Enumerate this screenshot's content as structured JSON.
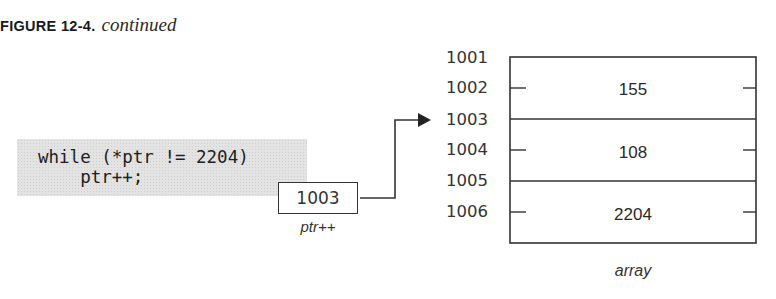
{
  "caption": {
    "label": "FIGURE 12-4.",
    "subtitle": "continued"
  },
  "code": {
    "lines": [
      "while (*ptr != 2204)",
      "    ptr++;"
    ]
  },
  "pointer": {
    "value": "1003",
    "label": "ptr++",
    "points_to_address": "1003"
  },
  "memory": {
    "addresses": [
      "1001",
      "1002",
      "1003",
      "1004",
      "1005",
      "1006"
    ],
    "cells": [
      {
        "start": "1001",
        "end": "1002",
        "value": "155"
      },
      {
        "start": "1003",
        "end": "1004",
        "value": "108"
      },
      {
        "start": "1005",
        "end": "1006",
        "value": "2204"
      }
    ],
    "label": "array"
  },
  "colors": {
    "code_background": "#e3e3e3",
    "line": "#333333",
    "text": "#2a2a2a"
  }
}
